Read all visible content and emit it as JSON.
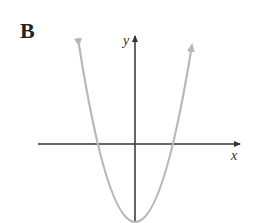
{
  "panel_label": "B",
  "diagram": {
    "type": "function-graph",
    "x_axis_label": "x",
    "y_axis_label": "y",
    "curve_color": "#b8b8b8",
    "axis_color": "#333333"
  }
}
